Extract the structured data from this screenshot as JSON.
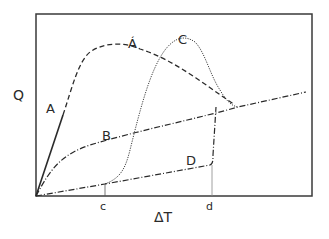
{
  "diagram": {
    "axes": {
      "y_label": "Q",
      "x_label": "ΔT",
      "x_ticks": [
        {
          "label": "c"
        },
        {
          "label": "d"
        }
      ]
    },
    "curves": [
      {
        "id": "A",
        "label": "A",
        "style": "solid"
      },
      {
        "id": "A_prime",
        "label": "Á",
        "style": "dashed"
      },
      {
        "id": "B",
        "label": "B",
        "style": "dash-dot"
      },
      {
        "id": "C",
        "label": "C",
        "style": "dotted"
      },
      {
        "id": "D",
        "label": "D",
        "style": "dash-dot"
      }
    ],
    "colors": {
      "line": "#2a2a2a",
      "frame": "#3a3a3a",
      "background": "#ffffff"
    }
  }
}
